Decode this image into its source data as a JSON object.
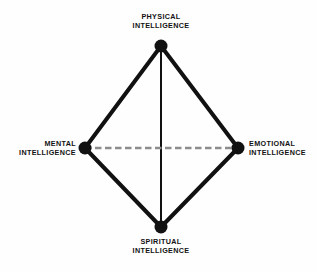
{
  "diagram": {
    "background_color": "#fefefe",
    "edge_color": "#111111",
    "node_color": "#111111",
    "axis_dashed_color": "#8c8c8c",
    "axis_solid_color": "#111111",
    "nodes": [
      {
        "id": "physical",
        "label_line1": "PHYSICAL",
        "label_line2": "INTELLIGENCE",
        "position": "top",
        "cx": 161,
        "cy": 46,
        "r": 6.5
      },
      {
        "id": "mental",
        "label_line1": "MENTAL",
        "label_line2": "INTELLIGENCE",
        "position": "left",
        "cx": 85,
        "cy": 148,
        "r": 6.5
      },
      {
        "id": "emotional",
        "label_line1": "EMOTIONAL",
        "label_line2": "INTELLIGENCE",
        "position": "right",
        "cx": 238,
        "cy": 148,
        "r": 6.5
      },
      {
        "id": "spiritual",
        "label_line1": "SPIRITUAL",
        "label_line2": "INTELLIGENCE",
        "position": "bottom",
        "cx": 161,
        "cy": 227,
        "r": 6.5
      }
    ],
    "edges": [
      {
        "id": "physical-mental",
        "from": "physical",
        "to": "mental",
        "style": "solid",
        "width": 4
      },
      {
        "id": "physical-emotional",
        "from": "physical",
        "to": "emotional",
        "style": "solid",
        "width": 4
      },
      {
        "id": "mental-spiritual",
        "from": "mental",
        "to": "spiritual",
        "style": "solid",
        "width": 4
      },
      {
        "id": "emotional-spiritual",
        "from": "emotional",
        "to": "spiritual",
        "style": "solid",
        "width": 4
      },
      {
        "id": "physical-spiritual",
        "from": "physical",
        "to": "spiritual",
        "style": "solid",
        "width": 2
      },
      {
        "id": "mental-emotional",
        "from": "mental",
        "to": "emotional",
        "style": "dashed",
        "width": 2.6
      }
    ]
  }
}
